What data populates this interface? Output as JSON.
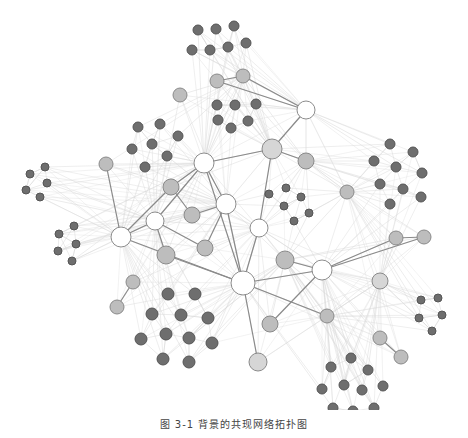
{
  "caption": "图 3-1  背景的共现网络拓扑图",
  "colors": {
    "hub_fill": "#ffffff",
    "hub_stroke": "#8c8c8c",
    "mid_fill": "#bdbdbd",
    "mid_stroke": "#8a8a8a",
    "leaf_fill": "#6e6e6e",
    "leaf_stroke": "#555555",
    "strong_edge": "#8a8a8a",
    "weak_edge": "#d9d9d9"
  },
  "nodes": [
    {
      "id": "h1",
      "x": 306,
      "y": 110,
      "r": 9,
      "type": "hub"
    },
    {
      "id": "h2",
      "x": 204,
      "y": 163,
      "r": 10,
      "type": "hub"
    },
    {
      "id": "h3",
      "x": 272,
      "y": 149,
      "r": 10,
      "type": "mid_light"
    },
    {
      "id": "h4",
      "x": 226,
      "y": 204,
      "r": 10,
      "type": "hub"
    },
    {
      "id": "h5",
      "x": 155,
      "y": 221,
      "r": 9,
      "type": "hub"
    },
    {
      "id": "h6",
      "x": 121,
      "y": 237,
      "r": 10,
      "type": "hub"
    },
    {
      "id": "h7",
      "x": 259,
      "y": 228,
      "r": 9,
      "type": "hub"
    },
    {
      "id": "h8",
      "x": 243,
      "y": 283,
      "r": 12,
      "type": "hub"
    },
    {
      "id": "h9",
      "x": 322,
      "y": 270,
      "r": 10,
      "type": "hub"
    },
    {
      "id": "m1",
      "x": 180,
      "y": 95,
      "r": 7,
      "type": "mid"
    },
    {
      "id": "m2",
      "x": 217,
      "y": 81,
      "r": 7,
      "type": "mid"
    },
    {
      "id": "m3",
      "x": 243,
      "y": 76,
      "r": 7,
      "type": "mid"
    },
    {
      "id": "m4",
      "x": 106,
      "y": 164,
      "r": 7,
      "type": "mid"
    },
    {
      "id": "m5",
      "x": 306,
      "y": 161,
      "r": 8,
      "type": "mid"
    },
    {
      "id": "m6",
      "x": 171,
      "y": 187,
      "r": 8,
      "type": "mid"
    },
    {
      "id": "m7",
      "x": 192,
      "y": 215,
      "r": 8,
      "type": "mid"
    },
    {
      "id": "m8",
      "x": 347,
      "y": 192,
      "r": 7,
      "type": "mid"
    },
    {
      "id": "m9",
      "x": 166,
      "y": 255,
      "r": 9,
      "type": "mid"
    },
    {
      "id": "m10",
      "x": 205,
      "y": 248,
      "r": 8,
      "type": "mid"
    },
    {
      "id": "m11",
      "x": 285,
      "y": 260,
      "r": 9,
      "type": "mid"
    },
    {
      "id": "m12",
      "x": 396,
      "y": 238,
      "r": 7,
      "type": "mid"
    },
    {
      "id": "m13",
      "x": 424,
      "y": 237,
      "r": 7,
      "type": "mid"
    },
    {
      "id": "m14",
      "x": 380,
      "y": 281,
      "r": 8,
      "type": "mid_light"
    },
    {
      "id": "m15",
      "x": 133,
      "y": 282,
      "r": 7,
      "type": "mid"
    },
    {
      "id": "m16",
      "x": 117,
      "y": 307,
      "r": 7,
      "type": "mid"
    },
    {
      "id": "m17",
      "x": 327,
      "y": 316,
      "r": 7,
      "type": "mid"
    },
    {
      "id": "m18",
      "x": 270,
      "y": 324,
      "r": 8,
      "type": "mid"
    },
    {
      "id": "m19",
      "x": 380,
      "y": 338,
      "r": 7,
      "type": "mid"
    },
    {
      "id": "m20",
      "x": 401,
      "y": 357,
      "r": 7,
      "type": "mid"
    },
    {
      "id": "m21",
      "x": 258,
      "y": 362,
      "r": 9,
      "type": "mid_light"
    },
    {
      "id": "c1a",
      "x": 198,
      "y": 30,
      "r": 5,
      "type": "leaf"
    },
    {
      "id": "c1b",
      "x": 216,
      "y": 29,
      "r": 5,
      "type": "leaf"
    },
    {
      "id": "c1c",
      "x": 234,
      "y": 26,
      "r": 5,
      "type": "leaf"
    },
    {
      "id": "c1d",
      "x": 192,
      "y": 50,
      "r": 5,
      "type": "leaf"
    },
    {
      "id": "c1e",
      "x": 210,
      "y": 50,
      "r": 5,
      "type": "leaf"
    },
    {
      "id": "c1f",
      "x": 228,
      "y": 47,
      "r": 5,
      "type": "leaf"
    },
    {
      "id": "c1g",
      "x": 246,
      "y": 43,
      "r": 5,
      "type": "leaf"
    },
    {
      "id": "c2a",
      "x": 217,
      "y": 105,
      "r": 5,
      "type": "leaf"
    },
    {
      "id": "c2b",
      "x": 235,
      "y": 105,
      "r": 5,
      "type": "leaf"
    },
    {
      "id": "c2c",
      "x": 256,
      "y": 104,
      "r": 5,
      "type": "leaf"
    },
    {
      "id": "c2d",
      "x": 218,
      "y": 120,
      "r": 5,
      "type": "leaf"
    },
    {
      "id": "c2e",
      "x": 248,
      "y": 121,
      "r": 5,
      "type": "leaf"
    },
    {
      "id": "c2f",
      "x": 231,
      "y": 128,
      "r": 5,
      "type": "leaf"
    },
    {
      "id": "c3a",
      "x": 138,
      "y": 127,
      "r": 5,
      "type": "leaf"
    },
    {
      "id": "c3b",
      "x": 160,
      "y": 124,
      "r": 5,
      "type": "leaf"
    },
    {
      "id": "c3c",
      "x": 178,
      "y": 136,
      "r": 5,
      "type": "leaf"
    },
    {
      "id": "c3d",
      "x": 132,
      "y": 149,
      "r": 5,
      "type": "leaf"
    },
    {
      "id": "c3e",
      "x": 152,
      "y": 144,
      "r": 5,
      "type": "leaf"
    },
    {
      "id": "c3f",
      "x": 167,
      "y": 156,
      "r": 5,
      "type": "leaf"
    },
    {
      "id": "c3g",
      "x": 145,
      "y": 167,
      "r": 5,
      "type": "leaf"
    },
    {
      "id": "c4a",
      "x": 30,
      "y": 174,
      "r": 4,
      "type": "leaf"
    },
    {
      "id": "c4b",
      "x": 45,
      "y": 167,
      "r": 4,
      "type": "leaf"
    },
    {
      "id": "c4c",
      "x": 26,
      "y": 190,
      "r": 4,
      "type": "leaf"
    },
    {
      "id": "c4d",
      "x": 47,
      "y": 183,
      "r": 4,
      "type": "leaf"
    },
    {
      "id": "c4e",
      "x": 40,
      "y": 197,
      "r": 4,
      "type": "leaf"
    },
    {
      "id": "c5a",
      "x": 74,
      "y": 226,
      "r": 4,
      "type": "leaf"
    },
    {
      "id": "c5b",
      "x": 59,
      "y": 234,
      "r": 4,
      "type": "leaf"
    },
    {
      "id": "c5c",
      "x": 76,
      "y": 244,
      "r": 4,
      "type": "leaf"
    },
    {
      "id": "c5d",
      "x": 58,
      "y": 251,
      "r": 4,
      "type": "leaf"
    },
    {
      "id": "c5e",
      "x": 72,
      "y": 261,
      "r": 4,
      "type": "leaf"
    },
    {
      "id": "c6a",
      "x": 269,
      "y": 194,
      "r": 4,
      "type": "leaf"
    },
    {
      "id": "c6b",
      "x": 286,
      "y": 188,
      "r": 4,
      "type": "leaf"
    },
    {
      "id": "c6c",
      "x": 301,
      "y": 197,
      "r": 4,
      "type": "leaf"
    },
    {
      "id": "c6d",
      "x": 284,
      "y": 206,
      "r": 4,
      "type": "leaf"
    },
    {
      "id": "c6e",
      "x": 309,
      "y": 213,
      "r": 4,
      "type": "leaf"
    },
    {
      "id": "c6f",
      "x": 294,
      "y": 221,
      "r": 4,
      "type": "leaf"
    },
    {
      "id": "c7a",
      "x": 390,
      "y": 144,
      "r": 5,
      "type": "leaf"
    },
    {
      "id": "c7b",
      "x": 413,
      "y": 152,
      "r": 5,
      "type": "leaf"
    },
    {
      "id": "c7c",
      "x": 374,
      "y": 161,
      "r": 5,
      "type": "leaf"
    },
    {
      "id": "c7d",
      "x": 396,
      "y": 167,
      "r": 5,
      "type": "leaf"
    },
    {
      "id": "c7e",
      "x": 422,
      "y": 173,
      "r": 5,
      "type": "leaf"
    },
    {
      "id": "c7f",
      "x": 380,
      "y": 184,
      "r": 5,
      "type": "leaf"
    },
    {
      "id": "c7g",
      "x": 403,
      "y": 189,
      "r": 5,
      "type": "leaf"
    },
    {
      "id": "c7h",
      "x": 421,
      "y": 197,
      "r": 5,
      "type": "leaf"
    },
    {
      "id": "c7i",
      "x": 390,
      "y": 204,
      "r": 5,
      "type": "leaf"
    },
    {
      "id": "c8a",
      "x": 168,
      "y": 294,
      "r": 6,
      "type": "leaf"
    },
    {
      "id": "c8b",
      "x": 195,
      "y": 294,
      "r": 6,
      "type": "leaf"
    },
    {
      "id": "c8c",
      "x": 152,
      "y": 314,
      "r": 6,
      "type": "leaf"
    },
    {
      "id": "c8d",
      "x": 181,
      "y": 315,
      "r": 6,
      "type": "leaf"
    },
    {
      "id": "c8e",
      "x": 208,
      "y": 318,
      "r": 6,
      "type": "leaf"
    },
    {
      "id": "c8f",
      "x": 141,
      "y": 339,
      "r": 6,
      "type": "leaf"
    },
    {
      "id": "c8g",
      "x": 166,
      "y": 334,
      "r": 6,
      "type": "leaf"
    },
    {
      "id": "c8h",
      "x": 189,
      "y": 338,
      "r": 6,
      "type": "leaf"
    },
    {
      "id": "c8i",
      "x": 212,
      "y": 343,
      "r": 6,
      "type": "leaf"
    },
    {
      "id": "c8j",
      "x": 163,
      "y": 359,
      "r": 6,
      "type": "leaf"
    },
    {
      "id": "c8k",
      "x": 189,
      "y": 362,
      "r": 6,
      "type": "leaf"
    },
    {
      "id": "c9a",
      "x": 421,
      "y": 300,
      "r": 4,
      "type": "leaf"
    },
    {
      "id": "c9b",
      "x": 438,
      "y": 298,
      "r": 4,
      "type": "leaf"
    },
    {
      "id": "c9c",
      "x": 419,
      "y": 318,
      "r": 4,
      "type": "leaf"
    },
    {
      "id": "c9d",
      "x": 442,
      "y": 315,
      "r": 4,
      "type": "leaf"
    },
    {
      "id": "c9e",
      "x": 432,
      "y": 331,
      "r": 4,
      "type": "leaf"
    },
    {
      "id": "c10a",
      "x": 351,
      "y": 358,
      "r": 5,
      "type": "leaf"
    },
    {
      "id": "c10b",
      "x": 331,
      "y": 367,
      "r": 5,
      "type": "leaf"
    },
    {
      "id": "c10c",
      "x": 368,
      "y": 370,
      "r": 5,
      "type": "leaf"
    },
    {
      "id": "c10d",
      "x": 344,
      "y": 385,
      "r": 5,
      "type": "leaf"
    },
    {
      "id": "c10e",
      "x": 362,
      "y": 390,
      "r": 5,
      "type": "leaf"
    },
    {
      "id": "c10f",
      "x": 322,
      "y": 389,
      "r": 5,
      "type": "leaf"
    },
    {
      "id": "c10g",
      "x": 383,
      "y": 386,
      "r": 5,
      "type": "leaf"
    },
    {
      "id": "c10h",
      "x": 333,
      "y": 408,
      "r": 5,
      "type": "leaf"
    },
    {
      "id": "c10i",
      "x": 353,
      "y": 411,
      "r": 5,
      "type": "leaf"
    },
    {
      "id": "c10j",
      "x": 374,
      "y": 408,
      "r": 5,
      "type": "leaf"
    }
  ],
  "strong_edges": [
    [
      "m2",
      "m3"
    ],
    [
      "m2",
      "h1"
    ],
    [
      "m3",
      "h1"
    ],
    [
      "h1",
      "h3"
    ],
    [
      "h3",
      "m5"
    ],
    [
      "h3",
      "h2"
    ],
    [
      "h3",
      "h7"
    ],
    [
      "h2",
      "m6"
    ],
    [
      "h2",
      "h4"
    ],
    [
      "h2",
      "h8"
    ],
    [
      "h2",
      "h5"
    ],
    [
      "m6",
      "m7"
    ],
    [
      "m7",
      "h4"
    ],
    [
      "m6",
      "h6"
    ],
    [
      "h5",
      "h6"
    ],
    [
      "h5",
      "m10"
    ],
    [
      "h6",
      "m4"
    ],
    [
      "h6",
      "h8"
    ],
    [
      "h4",
      "h8"
    ],
    [
      "h4",
      "m10"
    ],
    [
      "h7",
      "h8"
    ],
    [
      "h8",
      "m9"
    ],
    [
      "h8",
      "h9"
    ],
    [
      "h8",
      "m17"
    ],
    [
      "h8",
      "m21"
    ],
    [
      "m11",
      "h9"
    ],
    [
      "h9",
      "m12"
    ],
    [
      "h9",
      "m13"
    ],
    [
      "h9",
      "m18"
    ],
    [
      "m12",
      "m13"
    ],
    [
      "m15",
      "m16"
    ],
    [
      "m19",
      "m20"
    ],
    [
      "h5",
      "m9"
    ]
  ],
  "weak_hubs": [
    "h1",
    "h2",
    "h3",
    "h4",
    "h5",
    "h6",
    "h7",
    "h8",
    "h9",
    "m3",
    "m5",
    "m11",
    "m14",
    "m17",
    "m8"
  ]
}
